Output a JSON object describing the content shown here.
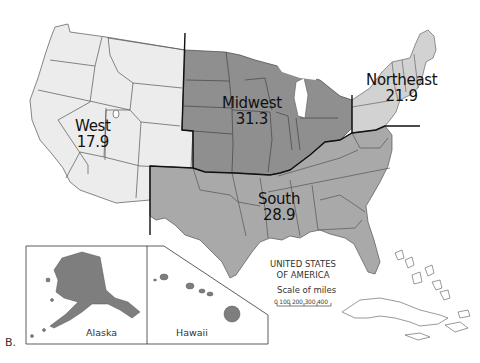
{
  "figure": {
    "letter": "B.",
    "country_title_line1": "UNITED STATES",
    "country_title_line2": "OF AMERICA"
  },
  "regions": [
    {
      "name": "West",
      "value": "17.9",
      "fill": "#ececec"
    },
    {
      "name": "Midwest",
      "value": "31.3",
      "fill": "#8f8f8f"
    },
    {
      "name": "Northeast",
      "value": "21.9",
      "fill": "#d2d2d2"
    },
    {
      "name": "South",
      "value": "28.9",
      "fill": "#a9a9a9"
    }
  ],
  "insets": {
    "alaska": "Alaska",
    "hawaii": "Hawaii"
  },
  "scale": {
    "title": "Scale of miles",
    "ticks": "0  100 200 300 400"
  },
  "colors": {
    "border": "#333333",
    "region_border": "#111111",
    "inset_fill": "#7e7e7e"
  }
}
